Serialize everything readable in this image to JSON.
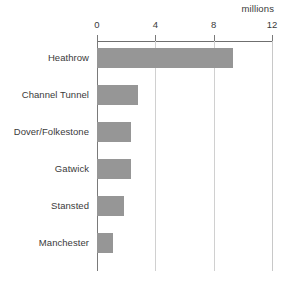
{
  "chart_data": {
    "type": "bar",
    "orientation": "horizontal",
    "title": "",
    "subtitle": "",
    "units_label": "millions",
    "xlabel": "",
    "ylabel": "",
    "categories": [
      "Heathrow",
      "Channel Tunnel",
      "Dover/Folkestone",
      "Gatwick",
      "Stansted",
      "Manchester"
    ],
    "values": [
      9.3,
      2.8,
      2.3,
      2.3,
      1.85,
      1.1
    ],
    "series": [
      {
        "name": "Passengers",
        "values": [
          9.3,
          2.8,
          2.3,
          2.3,
          1.85,
          1.1
        ]
      }
    ],
    "xlim": [
      0,
      12
    ],
    "xticks": [
      0,
      4,
      8,
      12
    ],
    "xtick_labels": [
      "0",
      "4",
      "8",
      "12"
    ],
    "grid": "vertical",
    "legend": "none",
    "bar_color": "#969696",
    "axis_color": "#6f6f6f",
    "grid_color": "#d0d0d0",
    "text_color": "#3a3a3a",
    "background": "#ffffff"
  }
}
